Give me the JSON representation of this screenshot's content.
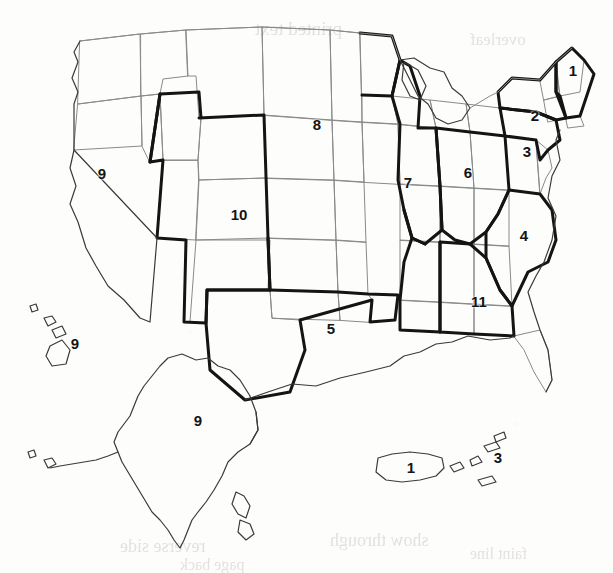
{
  "document": {
    "title": "Numbered Regions of the United States",
    "media": "scanned page, black and white line map",
    "background_color": "#fdfdfc",
    "ink_color": "#141414"
  },
  "map": {
    "name": "united-states-numbered-regions-map",
    "projection_note": "contiguous 48 states with Alaska, Hawaii, Puerto Rico and US Virgin Islands insets",
    "region_boundary_color": "#141414",
    "state_boundary_color": "#8a8a8a",
    "region_boundary_width": "3",
    "state_boundary_width": "1",
    "region_count": 11,
    "labels": [
      {
        "id": "label-1-new-england",
        "text": "1",
        "x": 573,
        "y": 70
      },
      {
        "id": "label-2-new-york",
        "text": "2",
        "x": 535,
        "y": 115
      },
      {
        "id": "label-3-mid-atlantic",
        "text": "3",
        "x": 527,
        "y": 151
      },
      {
        "id": "label-6-great-lakes-e",
        "text": "6",
        "x": 468,
        "y": 172
      },
      {
        "id": "label-4-southeast-atl",
        "text": "4",
        "x": 524,
        "y": 235
      },
      {
        "id": "label-7-great-lakes-w",
        "text": "7",
        "x": 408,
        "y": 182
      },
      {
        "id": "label-8-upper-midwest",
        "text": "8",
        "x": 317,
        "y": 124
      },
      {
        "id": "label-11-deep-south",
        "text": "11",
        "x": 479,
        "y": 301
      },
      {
        "id": "label-5-south-central",
        "text": "5",
        "x": 331,
        "y": 328
      },
      {
        "id": "label-10-mountain",
        "text": "10",
        "x": 239,
        "y": 214
      },
      {
        "id": "label-9-west-pacific",
        "text": "9",
        "x": 102,
        "y": 173
      },
      {
        "id": "label-9-hawaii",
        "text": "9",
        "x": 75,
        "y": 343
      },
      {
        "id": "label-9-alaska",
        "text": "9",
        "x": 198,
        "y": 420
      },
      {
        "id": "label-1-puerto-rico",
        "text": "1",
        "x": 411,
        "y": 467
      },
      {
        "id": "label-3-virgin-islands",
        "text": "3",
        "x": 498,
        "y": 457
      }
    ]
  },
  "bleed_through": [
    {
      "text": "printed text",
      "x": 255,
      "y": 18,
      "size": 19
    },
    {
      "text": "overleaf",
      "x": 470,
      "y": 30,
      "size": 17
    },
    {
      "text": "reverse side",
      "x": 120,
      "y": 536,
      "size": 18
    },
    {
      "text": "show through",
      "x": 330,
      "y": 530,
      "size": 18
    },
    {
      "text": "faint line",
      "x": 470,
      "y": 545,
      "size": 16
    },
    {
      "text": "page back",
      "x": 180,
      "y": 556,
      "size": 16
    }
  ]
}
